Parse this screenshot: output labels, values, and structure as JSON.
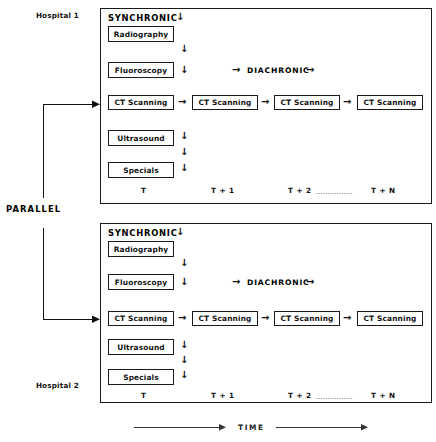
{
  "figure": {
    "parallel_label": "PARALLEL",
    "time_axis_label": "TIME"
  },
  "panels": [
    {
      "hospital_label": "Hospital 1",
      "synchronic_label": "SYNCHRONIC",
      "diachronic_label": "DIACHRONIC",
      "modalities": [
        "Radiography",
        "Fluoroscopy",
        "CT Scanning",
        "Ultrasound",
        "Specials"
      ],
      "ct_sequence": [
        "CT Scanning",
        "CT Scanning",
        "CT Scanning",
        "CT Scanning"
      ],
      "time_ticks": [
        "T",
        "T + 1",
        "T + 2",
        "T + N"
      ],
      "tick_leader": "................"
    },
    {
      "hospital_label": "Hospital 2",
      "synchronic_label": "SYNCHRONIC",
      "diachronic_label": "DIACHRONIC",
      "modalities": [
        "Radiography",
        "Fluoroscopy",
        "CT Scanning",
        "Ultrasound",
        "Specials"
      ],
      "ct_sequence": [
        "CT Scanning",
        "CT Scanning",
        "CT Scanning",
        "CT Scanning"
      ],
      "time_ticks": [
        "T",
        "T + 1",
        "T + 2",
        "T + N"
      ],
      "tick_leader": "................"
    }
  ],
  "glyphs": {
    "arrow_down": "↓",
    "arrow_right": "→"
  },
  "colors": {
    "ink": "#111111",
    "background": "#ffffff"
  }
}
